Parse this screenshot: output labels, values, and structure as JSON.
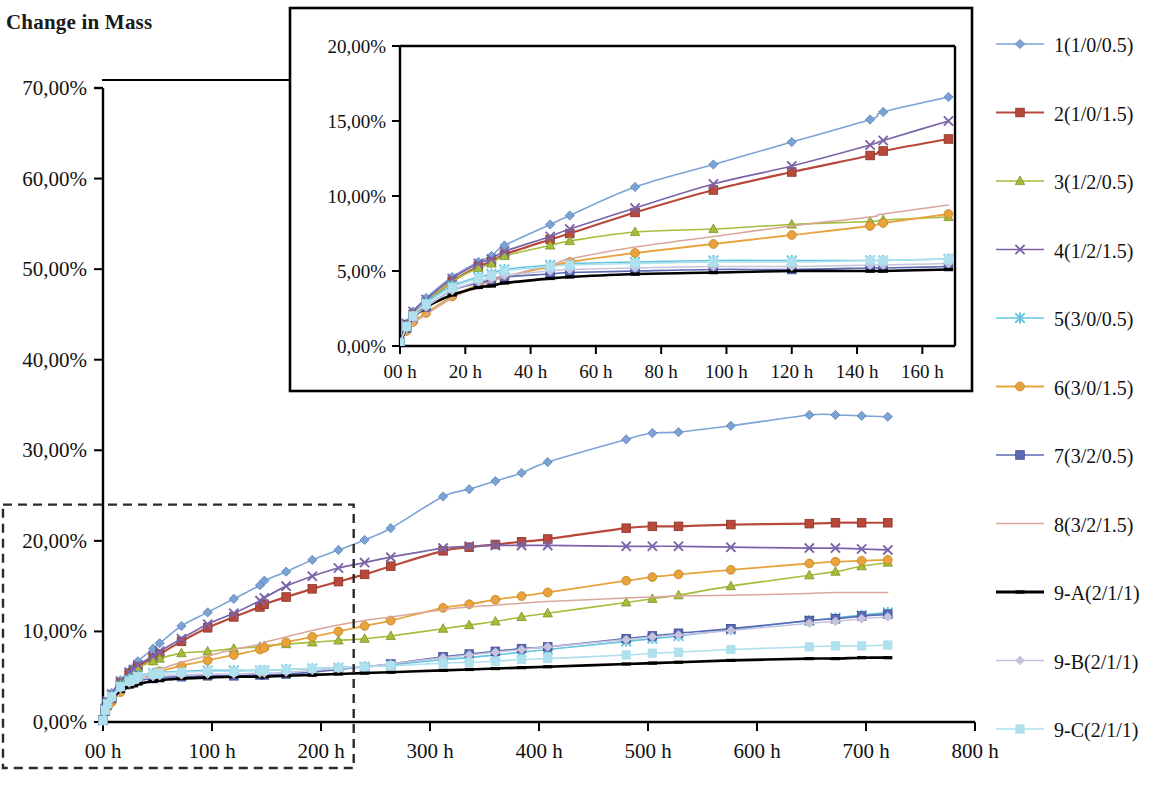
{
  "page": {
    "title": "Change in Mass",
    "clipped_top_text": "",
    "background": "#ffffff"
  },
  "chart_data": {
    "type": "line",
    "title": "Change in Mass",
    "xlabel": "",
    "ylabel": "",
    "grid": false,
    "legend_position": "right",
    "main_axis": {
      "x_ticks": [
        "00 h",
        "100 h",
        "200 h",
        "300 h",
        "400 h",
        "500 h",
        "600 h",
        "700 h",
        "800 h"
      ],
      "x_tick_values": [
        0,
        100,
        200,
        300,
        400,
        500,
        600,
        700,
        800
      ],
      "xlim": [
        0,
        800
      ],
      "y_ticks": [
        "0,00%",
        "10,00%",
        "20,00%",
        "30,00%",
        "40,00%",
        "50,00%",
        "60,00%",
        "70,00%"
      ],
      "y_tick_values": [
        0,
        10,
        20,
        30,
        40,
        50,
        60,
        70
      ],
      "ylim": [
        0,
        70
      ]
    },
    "inset_axis": {
      "x_ticks": [
        "00 h",
        "20 h",
        "40 h",
        "60 h",
        "80 h",
        "100 h",
        "120 h",
        "140 h",
        "160 h"
      ],
      "x_tick_values": [
        0,
        20,
        40,
        60,
        80,
        100,
        120,
        140,
        160
      ],
      "xlim": [
        0,
        170
      ],
      "y_ticks": [
        "0,00%",
        "5,00%",
        "10,00%",
        "15,00%",
        "20,00%"
      ],
      "y_tick_values": [
        0,
        5,
        10,
        15,
        20
      ],
      "ylim": [
        0,
        20
      ]
    },
    "zoom_region": {
      "x_range": [
        0,
        230
      ],
      "y_range": [
        0,
        24
      ]
    },
    "series": [
      {
        "name": "1(1/0/0.5)",
        "color": "#7ba3d6",
        "marker": "diamond",
        "width": 1.6,
        "x": [
          0,
          2,
          4,
          8,
          16,
          24,
          28,
          32,
          46,
          52,
          72,
          96,
          120,
          144,
          148,
          168,
          192,
          216,
          240,
          264,
          312,
          336,
          360,
          384,
          408,
          480,
          504,
          528,
          576,
          648,
          672,
          696,
          720
        ],
        "y": [
          0.2,
          1.5,
          2.3,
          3.2,
          4.6,
          5.6,
          6.0,
          6.7,
          8.1,
          8.7,
          10.6,
          12.1,
          13.6,
          15.1,
          15.6,
          16.6,
          17.9,
          19.0,
          20.1,
          21.4,
          24.9,
          25.7,
          26.6,
          27.5,
          28.7,
          31.2,
          31.9,
          32.0,
          32.7,
          33.9,
          33.9,
          33.8,
          33.7
        ]
      },
      {
        "name": "2(1/0/1.5)",
        "color": "#b8493a",
        "marker": "square",
        "width": 2.2,
        "x": [
          0,
          2,
          4,
          8,
          16,
          24,
          28,
          32,
          46,
          52,
          72,
          96,
          120,
          144,
          148,
          168,
          192,
          216,
          240,
          264,
          312,
          336,
          360,
          384,
          408,
          480,
          504,
          528,
          576,
          648,
          672,
          696,
          720
        ],
        "y": [
          0.2,
          1.4,
          2.1,
          2.9,
          4.3,
          5.3,
          5.6,
          6.1,
          7.1,
          7.5,
          8.9,
          10.4,
          11.6,
          12.7,
          13.0,
          13.8,
          14.7,
          15.5,
          16.3,
          17.2,
          18.9,
          19.3,
          19.6,
          19.9,
          20.2,
          21.4,
          21.6,
          21.6,
          21.8,
          21.9,
          22.0,
          22.0,
          22.0
        ]
      },
      {
        "name": "3(1/2/0.5)",
        "color": "#a4bd3a",
        "marker": "triangle",
        "width": 1.6,
        "x": [
          0,
          2,
          4,
          8,
          16,
          24,
          28,
          32,
          46,
          52,
          72,
          96,
          120,
          144,
          148,
          168,
          192,
          216,
          240,
          264,
          312,
          336,
          360,
          384,
          408,
          480,
          504,
          528,
          576,
          648,
          672,
          696,
          720
        ],
        "y": [
          0.2,
          1.3,
          2.1,
          2.9,
          4.3,
          5.2,
          5.5,
          6.0,
          6.7,
          7.0,
          7.6,
          7.8,
          8.1,
          8.3,
          8.4,
          8.6,
          8.8,
          9.0,
          9.2,
          9.5,
          10.3,
          10.7,
          11.1,
          11.6,
          12.0,
          13.2,
          13.6,
          14.0,
          15.0,
          16.2,
          16.6,
          17.2,
          17.6
        ]
      },
      {
        "name": "4(1/2/1.5)",
        "color": "#7b63a8",
        "marker": "cross",
        "width": 1.7,
        "x": [
          0,
          2,
          4,
          8,
          16,
          24,
          28,
          32,
          46,
          52,
          72,
          96,
          120,
          144,
          148,
          168,
          192,
          216,
          240,
          264,
          312,
          336,
          360,
          384,
          408,
          480,
          504,
          528,
          576,
          648,
          672,
          696,
          720
        ],
        "y": [
          0.2,
          1.5,
          2.3,
          3.1,
          4.5,
          5.5,
          5.8,
          6.3,
          7.3,
          7.8,
          9.2,
          10.8,
          12.0,
          13.4,
          13.7,
          15.0,
          16.1,
          17.0,
          17.6,
          18.2,
          19.2,
          19.4,
          19.5,
          19.5,
          19.5,
          19.4,
          19.4,
          19.4,
          19.3,
          19.2,
          19.2,
          19.1,
          19.0
        ]
      },
      {
        "name": "5(3/0/0.5)",
        "color": "#63c4df",
        "marker": "star",
        "width": 1.6,
        "x": [
          0,
          2,
          4,
          8,
          16,
          24,
          28,
          32,
          46,
          52,
          72,
          96,
          120,
          144,
          148,
          168,
          192,
          216,
          240,
          264,
          312,
          336,
          360,
          384,
          408,
          480,
          504,
          528,
          576,
          648,
          672,
          696,
          720
        ],
        "y": [
          0.2,
          1.3,
          2.0,
          2.9,
          4.0,
          4.6,
          4.8,
          5.1,
          5.4,
          5.5,
          5.6,
          5.7,
          5.7,
          5.7,
          5.7,
          5.8,
          5.9,
          6.0,
          6.1,
          6.3,
          6.9,
          7.1,
          7.4,
          7.7,
          8.0,
          8.9,
          9.2,
          9.5,
          10.2,
          11.2,
          11.5,
          11.8,
          12.1
        ]
      },
      {
        "name": "6(3/0/1.5)",
        "color": "#e8a33d",
        "marker": "circle",
        "width": 1.8,
        "x": [
          0,
          2,
          4,
          8,
          16,
          24,
          28,
          32,
          46,
          52,
          72,
          96,
          120,
          144,
          148,
          168,
          192,
          216,
          240,
          264,
          312,
          336,
          360,
          384,
          408,
          480,
          504,
          528,
          576,
          648,
          672,
          696,
          720
        ],
        "y": [
          0.2,
          1.0,
          1.6,
          2.2,
          3.3,
          4.1,
          4.3,
          4.6,
          5.3,
          5.6,
          6.2,
          6.8,
          7.4,
          8.0,
          8.2,
          8.8,
          9.4,
          10.0,
          10.6,
          11.2,
          12.6,
          13.0,
          13.5,
          13.9,
          14.3,
          15.6,
          16.0,
          16.3,
          16.8,
          17.5,
          17.7,
          17.8,
          17.9
        ]
      },
      {
        "name": "7(3/2/0.5)",
        "color": "#5b6ab5",
        "marker": "square-grid",
        "width": 1.7,
        "x": [
          0,
          2,
          4,
          8,
          16,
          24,
          28,
          32,
          46,
          52,
          72,
          96,
          120,
          144,
          148,
          168,
          192,
          216,
          240,
          264,
          312,
          336,
          360,
          384,
          408,
          480,
          504,
          528,
          576,
          648,
          672,
          696,
          720
        ],
        "y": [
          0.2,
          1.2,
          1.9,
          2.6,
          3.7,
          4.2,
          4.4,
          4.6,
          4.8,
          4.9,
          5.0,
          5.1,
          5.1,
          5.2,
          5.2,
          5.3,
          5.5,
          5.8,
          6.1,
          6.4,
          7.2,
          7.5,
          7.8,
          8.1,
          8.3,
          9.2,
          9.5,
          9.8,
          10.3,
          11.2,
          11.4,
          11.7,
          11.9
        ]
      },
      {
        "name": "8(3/2/1.5)",
        "color": "#d9a79a",
        "marker": "none",
        "width": 1.5,
        "x": [
          0,
          2,
          4,
          8,
          16,
          24,
          28,
          32,
          46,
          52,
          72,
          96,
          120,
          144,
          148,
          168,
          192,
          216,
          240,
          264,
          312,
          336,
          360,
          384,
          408,
          480,
          504,
          528,
          576,
          648,
          672,
          696,
          720
        ],
        "y": [
          0.2,
          0.9,
          1.5,
          2.1,
          3.2,
          4.0,
          4.3,
          4.6,
          5.4,
          5.8,
          6.6,
          7.3,
          8.0,
          8.6,
          8.8,
          9.4,
          10.1,
          10.7,
          11.2,
          11.6,
          12.4,
          12.7,
          12.9,
          13.1,
          13.3,
          13.7,
          13.8,
          13.9,
          14.0,
          14.2,
          14.3,
          14.3,
          14.3
        ]
      },
      {
        "name": "9-A(2/1/1)",
        "color": "#000000",
        "marker": "dash",
        "width": 2.6,
        "x": [
          0,
          2,
          4,
          8,
          16,
          24,
          28,
          32,
          46,
          52,
          72,
          96,
          120,
          144,
          148,
          168,
          192,
          216,
          240,
          264,
          312,
          336,
          360,
          384,
          408,
          480,
          504,
          528,
          576,
          648,
          672,
          696,
          720
        ],
        "y": [
          0.2,
          1.2,
          1.9,
          2.6,
          3.4,
          3.9,
          4.0,
          4.2,
          4.5,
          4.6,
          4.8,
          4.9,
          5.0,
          5.0,
          5.0,
          5.1,
          5.2,
          5.3,
          5.4,
          5.5,
          5.7,
          5.8,
          5.9,
          6.0,
          6.1,
          6.4,
          6.5,
          6.6,
          6.8,
          7.0,
          7.0,
          7.1,
          7.1
        ]
      },
      {
        "name": "9-B(2/1/1)",
        "color": "#c6c3dd",
        "marker": "diamond-open",
        "width": 1.5,
        "x": [
          0,
          2,
          4,
          8,
          16,
          24,
          28,
          32,
          46,
          52,
          72,
          96,
          120,
          144,
          148,
          168,
          192,
          216,
          240,
          264,
          312,
          336,
          360,
          384,
          408,
          480,
          504,
          528,
          576,
          648,
          672,
          696,
          720
        ],
        "y": [
          0.2,
          1.2,
          1.9,
          2.6,
          3.7,
          4.3,
          4.5,
          4.7,
          5.0,
          5.1,
          5.2,
          5.3,
          5.3,
          5.4,
          5.4,
          5.5,
          5.7,
          5.9,
          6.1,
          6.4,
          7.1,
          7.4,
          7.7,
          8.0,
          8.3,
          9.1,
          9.4,
          9.6,
          10.1,
          10.9,
          11.1,
          11.4,
          11.6
        ]
      },
      {
        "name": "9-C(2/1/1)",
        "color": "#aee0ee",
        "marker": "square-open",
        "width": 1.6,
        "x": [
          0,
          2,
          4,
          8,
          16,
          24,
          28,
          32,
          46,
          52,
          72,
          96,
          120,
          144,
          148,
          168,
          192,
          216,
          240,
          264,
          312,
          336,
          360,
          384,
          408,
          480,
          504,
          528,
          576,
          648,
          672,
          696,
          720
        ],
        "y": [
          0.2,
          1.3,
          2.0,
          2.8,
          3.9,
          4.5,
          4.7,
          5.0,
          5.3,
          5.4,
          5.5,
          5.6,
          5.6,
          5.7,
          5.7,
          5.8,
          5.9,
          6.0,
          6.1,
          6.2,
          6.5,
          6.6,
          6.7,
          6.9,
          7.0,
          7.4,
          7.6,
          7.7,
          8.0,
          8.3,
          8.4,
          8.4,
          8.5
        ]
      }
    ]
  },
  "legend": {
    "items": [
      {
        "label": "1(1/0/0.5)",
        "color": "#7ba3d6",
        "marker": "diamond"
      },
      {
        "label": "2(1/0/1.5)",
        "color": "#b8493a",
        "marker": "square"
      },
      {
        "label": "3(1/2/0.5)",
        "color": "#a4bd3a",
        "marker": "triangle"
      },
      {
        "label": "4(1/2/1.5)",
        "color": "#7b63a8",
        "marker": "cross"
      },
      {
        "label": "5(3/0/0.5)",
        "color": "#63c4df",
        "marker": "star"
      },
      {
        "label": "6(3/0/1.5)",
        "color": "#e8a33d",
        "marker": "circle"
      },
      {
        "label": "7(3/2/0.5)",
        "color": "#5b6ab5",
        "marker": "square-grid"
      },
      {
        "label": "8(3/2/1.5)",
        "color": "#d9a79a",
        "marker": "none"
      },
      {
        "label": "9-A(2/1/1)",
        "color": "#000000",
        "marker": "dash"
      },
      {
        "label": "9-B(2/1/1)",
        "color": "#c6c3dd",
        "marker": "diamond-open"
      },
      {
        "label": "9-C(2/1/1)",
        "color": "#aee0ee",
        "marker": "square-open"
      }
    ]
  }
}
